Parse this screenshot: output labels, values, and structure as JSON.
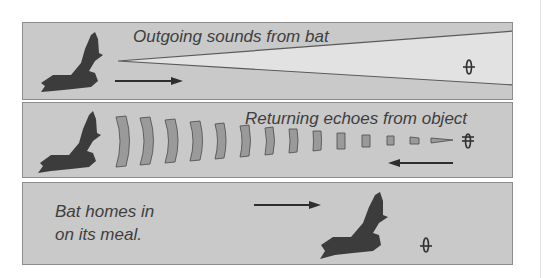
{
  "diagram": {
    "type": "echolocation-sequence",
    "colors": {
      "panel_bg": "#c9c9c9",
      "beam_fill": "#e2e2e2",
      "bat": "#3c3c3c",
      "echo_fill": "#9a9a9a",
      "arrow": "#2e2e2e",
      "text": "#3e3e3e"
    },
    "panels": [
      {
        "id": "outgoing",
        "label": "Outgoing sounds from bat",
        "elements": [
          "bat-icon",
          "sound-beam",
          "arrow-right",
          "moth-icon"
        ]
      },
      {
        "id": "returning",
        "label": "Returning echoes from object",
        "elements": [
          "bat-icon",
          "echo-waves",
          "arrow-left",
          "moth-icon"
        ],
        "echo_wave_count": 14
      },
      {
        "id": "homing",
        "label_line1": "Bat homes in",
        "label_line2": "on its meal.",
        "elements": [
          "arrow-right",
          "bat-icon",
          "moth-icon"
        ]
      }
    ]
  }
}
